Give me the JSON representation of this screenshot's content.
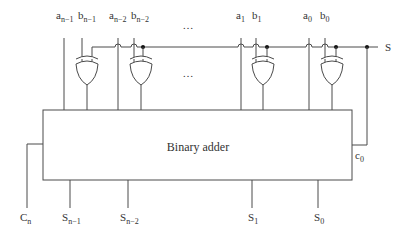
{
  "diagram": {
    "title": "Binary adder",
    "output_bus_label": "S",
    "carry_in_label": {
      "base": "c",
      "sub": "0"
    },
    "carry_out_label": {
      "base": "C",
      "sub": "n"
    },
    "ellipsis": "…",
    "inputs": [
      {
        "a": {
          "base": "a",
          "sub": "n−1"
        },
        "b": {
          "base": "b",
          "sub": "n−1"
        }
      },
      {
        "a": {
          "base": "a",
          "sub": "n−2"
        },
        "b": {
          "base": "b",
          "sub": "n−2"
        }
      },
      {
        "a": {
          "base": "a",
          "sub": "1"
        },
        "b": {
          "base": "b",
          "sub": "1"
        }
      },
      {
        "a": {
          "base": "a",
          "sub": "0"
        },
        "b": {
          "base": "b",
          "sub": "0"
        }
      }
    ],
    "outputs": [
      {
        "base": "S",
        "sub": "n−1"
      },
      {
        "base": "S",
        "sub": "n−2"
      },
      {
        "base": "S",
        "sub": "1"
      },
      {
        "base": "S",
        "sub": "0"
      }
    ],
    "colors": {
      "line": "#4a4a4a",
      "text": "#333333",
      "background": "#ffffff"
    }
  }
}
